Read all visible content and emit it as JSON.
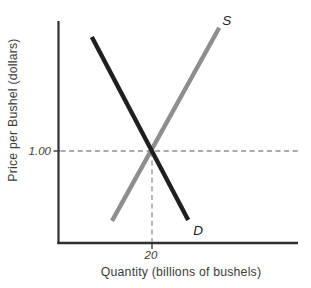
{
  "figure": {
    "background": "#ffffff",
    "axis_color": "#2e2e2e",
    "guide_color": "#8f8f8f"
  },
  "chart_data": {
    "type": "line",
    "title": "",
    "xlabel": "Quantity (billions of bushels)",
    "ylabel": "Price per Bushel (dollars)",
    "x_unit": "billions of bushels",
    "y_unit": "dollars per bushel",
    "grid": false,
    "axes": {
      "x_ticks": [
        {
          "value": 20,
          "label": "20"
        }
      ],
      "y_ticks": [
        {
          "value": 1.0,
          "label": "1.00"
        }
      ]
    },
    "series": [
      {
        "name": "S",
        "role": "supply",
        "color": "#8e8e8e",
        "points": [
          [
            11.5,
            0.24
          ],
          [
            34.3,
            2.34
          ]
        ]
      },
      {
        "name": "D",
        "role": "demand",
        "color": "#1f1f1f",
        "points": [
          [
            7.2,
            2.24
          ],
          [
            27.7,
            0.25
          ]
        ]
      }
    ],
    "equilibrium": {
      "quantity": 20,
      "price": 1.0,
      "quantity_label": "20",
      "price_label": "1.00",
      "dashed_guides": true
    }
  }
}
